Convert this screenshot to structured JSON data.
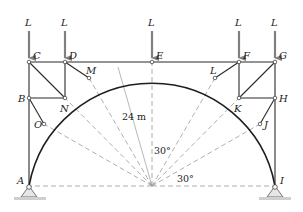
{
  "diagram": {
    "type": "truss-arch",
    "loads": [
      {
        "label": "L",
        "at": "C"
      },
      {
        "label": "L",
        "at": "D"
      },
      {
        "label": "L",
        "at": "E"
      },
      {
        "label": "L",
        "at": "F"
      },
      {
        "label": "L",
        "at": "G"
      }
    ],
    "joints": {
      "A": "A",
      "B": "B",
      "C": "C",
      "D": "D",
      "E": "E",
      "F": "F",
      "G": "G",
      "H": "H",
      "I": "I",
      "J": "J",
      "K": "K",
      "L": "L",
      "M": "M",
      "N": "N",
      "O": "O"
    },
    "dimensions": {
      "radius": "24 m",
      "angle_top": "30°",
      "angle_bottom": "30°"
    },
    "supports": [
      "A",
      "I"
    ],
    "colors": {
      "member": "#2a2a2a",
      "load_arrow": "#808080",
      "construction_line": "#9a9a9a",
      "ground": "#cfcfcf"
    }
  }
}
